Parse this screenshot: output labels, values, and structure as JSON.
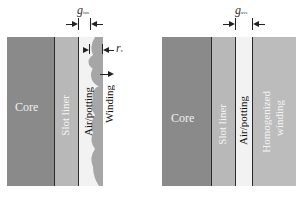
{
  "left_panel": {
    "labels": {
      "core": "Core",
      "slot_liner": "Slot liner",
      "air_potting": "Air/potting",
      "winding": "Winding"
    },
    "dimensions": {
      "gap_symbol": "g",
      "gap_subscript": "ins",
      "radius_symbol": "r",
      "radius_subscript": "c"
    }
  },
  "right_panel": {
    "labels": {
      "core": "Core",
      "slot_liner": "Slot liner",
      "air_potting": "Air/potting",
      "homogenized_winding_line1": "Homogenized",
      "homogenized_winding_line2": "winding"
    },
    "dimensions": {
      "gap_symbol": "g",
      "gap_subscript": "ave"
    }
  },
  "colors": {
    "core": "#8a8a8a",
    "slot_liner": "#b8b8b8",
    "air_potting": "#f2f2f2",
    "winding": "#a6a6a6",
    "homogenized_winding": "#bcbcbc",
    "divider": "#2a2a2a"
  }
}
